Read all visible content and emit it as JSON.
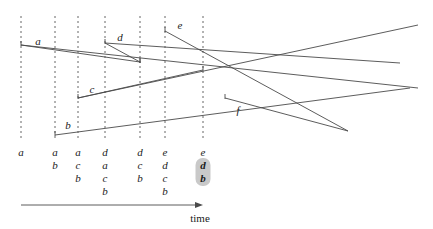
{
  "figure": {
    "type": "timeline-stack-diagram",
    "axis": {
      "label": "time",
      "label_x": 200,
      "label_y": 212,
      "arrow_x1": 21,
      "arrow_x2": 203,
      "arrow_y": 205
    },
    "colors": {
      "line": "#4a4a4a",
      "dashed": "#555555",
      "text": "#1a1a1a",
      "highlight": "#c9c9c9",
      "background": "#ffffff"
    },
    "event_lines": [
      {
        "id": "t1",
        "x": 21,
        "y1": 16,
        "y2": 140
      },
      {
        "id": "t2",
        "x": 55,
        "y1": 16,
        "y2": 140
      },
      {
        "id": "t3",
        "x": 78,
        "y1": 16,
        "y2": 140
      },
      {
        "id": "t4",
        "x": 105,
        "y1": 16,
        "y2": 140
      },
      {
        "id": "t5",
        "x": 140,
        "y1": 16,
        "y2": 140
      },
      {
        "id": "t6",
        "x": 165,
        "y1": 16,
        "y2": 140
      },
      {
        "id": "t7",
        "x": 203,
        "y1": 16,
        "y2": 140
      }
    ],
    "segments": [
      {
        "id": "a",
        "label": "a",
        "label_x": 38,
        "label_y": 41,
        "x1": 21,
        "y1": 45,
        "x2": 418,
        "y2": 88,
        "cap": "left"
      },
      {
        "id": "d",
        "label": "d",
        "label_x": 120,
        "label_y": 37,
        "x1": 105,
        "y1": 43,
        "x2": 400,
        "y2": 63,
        "cap": "left"
      },
      {
        "id": "e",
        "label": "e",
        "label_x": 180,
        "label_y": 25,
        "x1": 165,
        "y1": 31,
        "x2": 348,
        "y2": 131,
        "cap": "left"
      },
      {
        "id": "c",
        "label": "c",
        "label_x": 92,
        "label_y": 89,
        "x1": 78,
        "y1": 98,
        "x2": 418,
        "y2": 25,
        "cap": "left"
      },
      {
        "id": "b",
        "label": "b",
        "label_x": 68,
        "label_y": 125,
        "x1": 55,
        "y1": 135,
        "x2": 410,
        "y2": 88,
        "cap": "left"
      },
      {
        "id": "f",
        "label": "f",
        "label_x": 238,
        "label_y": 110,
        "x1": 225,
        "y1": 98,
        "x2": 348,
        "y2": 131,
        "cap": "left"
      }
    ],
    "short_segments": [
      {
        "id": "a-end",
        "x1": 21,
        "y1": 45,
        "x2": 140,
        "y2": 62
      },
      {
        "id": "d-end",
        "x1": 105,
        "y1": 43,
        "x2": 140,
        "y2": 62
      },
      {
        "id": "c-end",
        "x1": 78,
        "y1": 98,
        "x2": 203,
        "y2": 70
      }
    ],
    "stacks": [
      {
        "x": 21,
        "y": 146,
        "items": [
          {
            "text": "a",
            "highlight": false
          }
        ]
      },
      {
        "x": 55,
        "y": 146,
        "items": [
          {
            "text": "a",
            "highlight": false
          },
          {
            "text": "b",
            "highlight": false
          }
        ]
      },
      {
        "x": 78,
        "y": 146,
        "items": [
          {
            "text": "a",
            "highlight": false
          },
          {
            "text": "c",
            "highlight": false
          },
          {
            "text": "b",
            "highlight": false
          }
        ]
      },
      {
        "x": 105,
        "y": 146,
        "items": [
          {
            "text": "d",
            "highlight": false
          },
          {
            "text": "a",
            "highlight": false
          },
          {
            "text": "c",
            "highlight": false
          },
          {
            "text": "b",
            "highlight": false
          }
        ]
      },
      {
        "x": 140,
        "y": 146,
        "items": [
          {
            "text": "d",
            "highlight": false
          },
          {
            "text": "c",
            "highlight": false
          },
          {
            "text": "b",
            "highlight": false
          }
        ]
      },
      {
        "x": 165,
        "y": 146,
        "items": [
          {
            "text": "e",
            "highlight": false
          },
          {
            "text": "d",
            "highlight": false
          },
          {
            "text": "c",
            "highlight": false
          },
          {
            "text": "b",
            "highlight": false
          }
        ]
      },
      {
        "x": 203,
        "y": 146,
        "items": [
          {
            "text": "e",
            "highlight": false
          },
          {
            "text": "d",
            "highlight": true
          },
          {
            "text": "b",
            "highlight": true
          }
        ]
      }
    ]
  }
}
